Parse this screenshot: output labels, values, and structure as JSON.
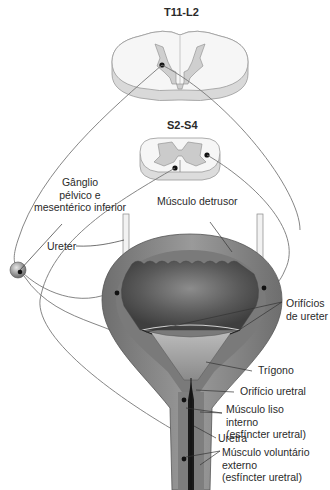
{
  "diagram": {
    "spinal_segments": [
      {
        "id": "upper",
        "label": "T11-L2"
      },
      {
        "id": "lower",
        "label": "S2-S4"
      }
    ],
    "labels": {
      "ganglion": [
        "Gânglio",
        "pélvico e",
        "mesentérico inferior"
      ],
      "detrusor": "Músculo detrusor",
      "ureter": "Ureter",
      "ureter_orifices": [
        "Orifícios",
        "de ureter"
      ],
      "trigone": "Trígono",
      "urethral_orifice": "Orifício uretral",
      "internal_sphincter": [
        "Músculo liso",
        "interno",
        "(esfíncter uretral)"
      ],
      "urethra": "Uretra",
      "external_sphincter": [
        "Músculo voluntário",
        "externo",
        "(esfíncter uretral)"
      ]
    },
    "colors": {
      "background": "#ffffff",
      "white_matter": "#f4f4f4",
      "gray_matter": "#c8c8c8",
      "bladder_wall": "#8a8a8a",
      "bladder_lumen": "#5e5e5e",
      "nerve_line": "#777777",
      "leader_line": "#333333",
      "nucleus_dot": "#111111"
    }
  }
}
